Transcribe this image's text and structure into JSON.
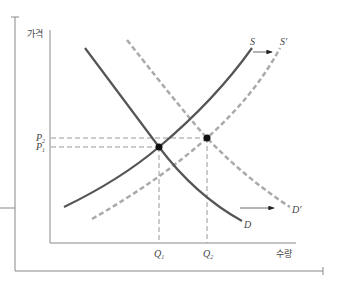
{
  "diagram": {
    "title": "",
    "axes": {
      "y_label": "가격",
      "x_label": "수량"
    },
    "curves": {
      "supply": {
        "label": "S",
        "style": "solid",
        "color": "#555555"
      },
      "supply_shifted": {
        "label": "S′",
        "style": "dashed",
        "color": "#aaaaaa"
      },
      "demand": {
        "label": "D",
        "style": "solid",
        "color": "#555555"
      },
      "demand_shifted": {
        "label": "D′",
        "style": "dashed",
        "color": "#aaaaaa"
      }
    },
    "price_ticks": [
      {
        "label": "P",
        "sub": "2"
      },
      {
        "label": "P",
        "sub": "1"
      }
    ],
    "quantity_ticks": [
      {
        "label": "Q",
        "sub": "1"
      },
      {
        "label": "Q",
        "sub": "2"
      }
    ],
    "equilibria": [
      {
        "name": "E1",
        "price": "P1",
        "quantity": "Q1"
      },
      {
        "name": "E2",
        "price": "P2",
        "quantity": "Q2"
      }
    ],
    "shift_arrows": [
      {
        "from": "S",
        "to": "S′",
        "direction": "right"
      },
      {
        "from": "D",
        "to": "D′",
        "direction": "right"
      }
    ]
  }
}
